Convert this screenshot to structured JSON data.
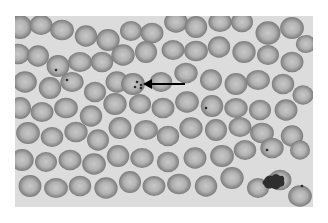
{
  "image": {
    "subject": "blood smear micrograph",
    "palette": {
      "background": "#dcdcdc",
      "cell_rim": "#8a8a8a",
      "cell_center": "#c4c4c4",
      "arrow": "#000000",
      "page": "#ffffff"
    },
    "annotations": [
      {
        "type": "arrow",
        "points_to": "infected-red-blood-cell",
        "from": [
          185,
          84
        ],
        "to": [
          143,
          84
        ]
      }
    ],
    "cells": [
      [
        20,
        27,
        12
      ],
      [
        41,
        25,
        11
      ],
      [
        62,
        30,
        11
      ],
      [
        86,
        36,
        11
      ],
      [
        108,
        40,
        11
      ],
      [
        131,
        31,
        11
      ],
      [
        152,
        33,
        11
      ],
      [
        176,
        22,
        11
      ],
      [
        196,
        27,
        11
      ],
      [
        220,
        22,
        11
      ],
      [
        242,
        22,
        11
      ],
      [
        268,
        33,
        12
      ],
      [
        292,
        28,
        11
      ],
      [
        306,
        44,
        10
      ],
      [
        18,
        54,
        11
      ],
      [
        38,
        56,
        11
      ],
      [
        58,
        66,
        11
      ],
      [
        80,
        62,
        11
      ],
      [
        102,
        62,
        11
      ],
      [
        123,
        55,
        11
      ],
      [
        146,
        52,
        11
      ],
      [
        173,
        50,
        11
      ],
      [
        196,
        51,
        11
      ],
      [
        219,
        47,
        11
      ],
      [
        244,
        52,
        11
      ],
      [
        268,
        55,
        11
      ],
      [
        292,
        62,
        11
      ],
      [
        25,
        82,
        11
      ],
      [
        50,
        88,
        11
      ],
      [
        72,
        82,
        11
      ],
      [
        95,
        92,
        11
      ],
      [
        117,
        82,
        11
      ],
      [
        133,
        84,
        11
      ],
      [
        161,
        82,
        11
      ],
      [
        186,
        73,
        11
      ],
      [
        211,
        80,
        11
      ],
      [
        236,
        84,
        11
      ],
      [
        258,
        80,
        11
      ],
      [
        283,
        84,
        11
      ],
      [
        303,
        95,
        10
      ],
      [
        20,
        108,
        11
      ],
      [
        42,
        112,
        11
      ],
      [
        66,
        108,
        11
      ],
      [
        91,
        116,
        11
      ],
      [
        115,
        104,
        11
      ],
      [
        140,
        104,
        11
      ],
      [
        163,
        108,
        11
      ],
      [
        187,
        102,
        11
      ],
      [
        212,
        106,
        11
      ],
      [
        236,
        108,
        11
      ],
      [
        260,
        110,
        11
      ],
      [
        286,
        110,
        11
      ],
      [
        28,
        133,
        11
      ],
      [
        52,
        137,
        11
      ],
      [
        76,
        132,
        11
      ],
      [
        98,
        140,
        11
      ],
      [
        120,
        128,
        11
      ],
      [
        146,
        130,
        11
      ],
      [
        168,
        136,
        11
      ],
      [
        191,
        128,
        11
      ],
      [
        216,
        130,
        11
      ],
      [
        240,
        127,
        11
      ],
      [
        262,
        133,
        11
      ],
      [
        292,
        136,
        11
      ],
      [
        22,
        160,
        11
      ],
      [
        46,
        162,
        11
      ],
      [
        70,
        160,
        11
      ],
      [
        94,
        164,
        11
      ],
      [
        118,
        156,
        11
      ],
      [
        142,
        158,
        11
      ],
      [
        168,
        162,
        11
      ],
      [
        195,
        158,
        11
      ],
      [
        222,
        156,
        11
      ],
      [
        245,
        150,
        11
      ],
      [
        272,
        148,
        11
      ],
      [
        300,
        150,
        10
      ],
      [
        30,
        186,
        11
      ],
      [
        56,
        188,
        11
      ],
      [
        80,
        186,
        11
      ],
      [
        106,
        188,
        11
      ],
      [
        130,
        182,
        11
      ],
      [
        154,
        186,
        11
      ],
      [
        179,
        184,
        11
      ],
      [
        206,
        186,
        11
      ],
      [
        232,
        178,
        11
      ],
      [
        258,
        188,
        11
      ],
      [
        280,
        180,
        11
      ],
      [
        300,
        196,
        11
      ]
    ],
    "dark_cluster": {
      "x": 273,
      "y": 182
    },
    "inclusions": [
      [
        56,
        70
      ],
      [
        137,
        82
      ],
      [
        141,
        85
      ],
      [
        135,
        87
      ],
      [
        141,
        88
      ],
      [
        206,
        108
      ],
      [
        267,
        150
      ],
      [
        302,
        186
      ],
      [
        67,
        80
      ]
    ]
  }
}
